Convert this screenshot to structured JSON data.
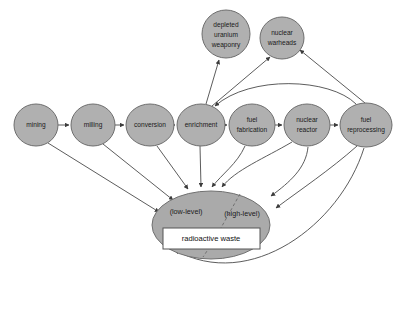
{
  "diagram": {
    "background_color": "#ffffff",
    "node_fill_color": "#b0b0b0",
    "node_stroke_color": "#6e6e6e",
    "edge_color": "#4a4a4a",
    "waste_fill_color": "#aaaaaa",
    "waste_box_fill_color": "#ffffff",
    "nodes": [
      {
        "id": "mining",
        "label": "mining",
        "lines": [
          "mining"
        ],
        "cx": 36,
        "cy": 125,
        "rx": 22,
        "ry": 21
      },
      {
        "id": "milling",
        "label": "milling",
        "lines": [
          "milling"
        ],
        "cx": 93,
        "cy": 125,
        "rx": 22,
        "ry": 21
      },
      {
        "id": "conversion",
        "label": "conversion",
        "lines": [
          "conversion"
        ],
        "cx": 150,
        "cy": 125,
        "rx": 24,
        "ry": 21
      },
      {
        "id": "enrichment",
        "label": "enrichment",
        "lines": [
          "enrichment"
        ],
        "cx": 201,
        "cy": 125,
        "rx": 24,
        "ry": 21
      },
      {
        "id": "fuel-fabrication",
        "label": "fuel fabrication",
        "lines": [
          "fuel",
          "fabrication"
        ],
        "cx": 252,
        "cy": 125,
        "rx": 23,
        "ry": 21
      },
      {
        "id": "nuclear-reactor",
        "label": "nuclear reactor",
        "lines": [
          "nuclear",
          "reactor"
        ],
        "cx": 307,
        "cy": 125,
        "rx": 23,
        "ry": 21
      },
      {
        "id": "fuel-reprocessing",
        "label": "fuel reprocessing",
        "lines": [
          "fuel",
          "reprocessing"
        ],
        "cx": 366,
        "cy": 125,
        "rx": 26,
        "ry": 22
      },
      {
        "id": "depleted-uranium-weaponry",
        "label": "depleted uranium weaponry",
        "lines": [
          "depleted",
          "uranium",
          "weaponry"
        ],
        "cx": 226,
        "cy": 34,
        "rx": 24,
        "ry": 24
      },
      {
        "id": "nuclear-warheads",
        "label": "nuclear warheads",
        "lines": [
          "nuclear",
          "warheads"
        ],
        "cx": 282,
        "cy": 38,
        "rx": 22,
        "ry": 21
      }
    ],
    "waste": {
      "id": "radioactive-waste",
      "cx": 211,
      "cy": 225,
      "rx": 59,
      "ry": 34,
      "low_level_label": "(low-level)",
      "high_level_label": "(high-level)",
      "box_label": "radioactive waste"
    },
    "edges": [
      {
        "from": "mining",
        "to": "milling"
      },
      {
        "from": "milling",
        "to": "conversion"
      },
      {
        "from": "conversion",
        "to": "enrichment"
      },
      {
        "from": "enrichment",
        "to": "fuel-fabrication"
      },
      {
        "from": "fuel-fabrication",
        "to": "nuclear-reactor"
      },
      {
        "from": "nuclear-reactor",
        "to": "fuel-reprocessing"
      },
      {
        "from": "enrichment",
        "to": "depleted-uranium-weaponry"
      },
      {
        "from": "enrichment",
        "to": "nuclear-warheads"
      },
      {
        "from": "fuel-reprocessing",
        "to": "nuclear-warheads"
      },
      {
        "from": "fuel-reprocessing",
        "to": "enrichment"
      },
      {
        "from": "mining",
        "to": "radioactive-waste"
      },
      {
        "from": "milling",
        "to": "radioactive-waste"
      },
      {
        "from": "conversion",
        "to": "radioactive-waste"
      },
      {
        "from": "enrichment",
        "to": "radioactive-waste"
      },
      {
        "from": "fuel-fabrication",
        "to": "radioactive-waste"
      },
      {
        "from": "nuclear-reactor",
        "to": "radioactive-waste"
      },
      {
        "from": "fuel-reprocessing",
        "to": "radioactive-waste"
      }
    ]
  }
}
